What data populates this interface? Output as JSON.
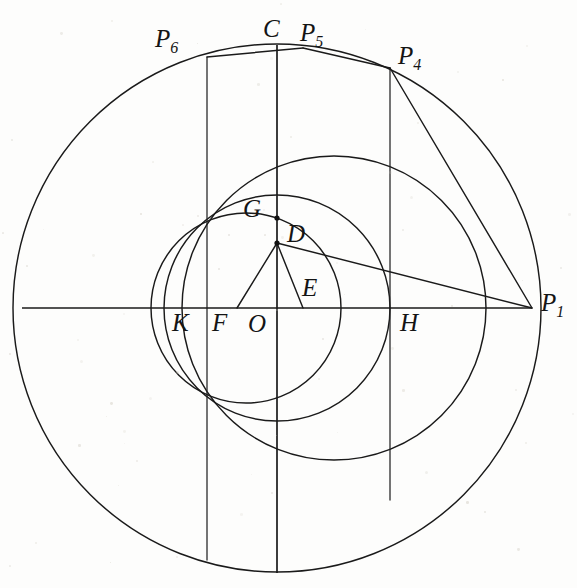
{
  "figure": {
    "background_color": "#fdfdfc",
    "ink_color": "#1a1a1a",
    "width": 577,
    "height": 588
  },
  "labels": [
    {
      "id": "P6",
      "base": "P",
      "sub": "6",
      "x": 155,
      "y": 26,
      "name": "label-p6"
    },
    {
      "id": "C",
      "base": "C",
      "sub": "",
      "x": 263,
      "y": 16,
      "name": "label-c"
    },
    {
      "id": "P5",
      "base": "P",
      "sub": "5",
      "x": 300,
      "y": 20,
      "name": "label-p5"
    },
    {
      "id": "P4",
      "base": "P",
      "sub": "4",
      "x": 398,
      "y": 43,
      "name": "label-p4"
    },
    {
      "id": "G",
      "base": "G",
      "sub": "",
      "x": 243,
      "y": 196,
      "name": "label-g"
    },
    {
      "id": "D",
      "base": "D",
      "sub": "",
      "x": 287,
      "y": 221,
      "name": "label-d"
    },
    {
      "id": "E",
      "base": "E",
      "sub": "",
      "x": 302,
      "y": 275,
      "name": "label-e"
    },
    {
      "id": "K",
      "base": "K",
      "sub": "",
      "x": 172,
      "y": 310,
      "name": "label-k"
    },
    {
      "id": "F",
      "base": "F",
      "sub": "",
      "x": 212,
      "y": 310,
      "name": "label-f"
    },
    {
      "id": "O",
      "base": "O",
      "sub": "",
      "x": 248,
      "y": 311,
      "name": "label-o"
    },
    {
      "id": "H",
      "base": "H",
      "sub": "",
      "x": 400,
      "y": 310,
      "name": "label-h"
    },
    {
      "id": "P1",
      "base": "P",
      "sub": "1",
      "x": 541,
      "y": 290,
      "name": "label-p1"
    }
  ],
  "points": {
    "O": {
      "x": 277,
      "y": 308
    },
    "C": {
      "x": 277,
      "y": 45
    },
    "P1": {
      "x": 532,
      "y": 308
    },
    "P4": {
      "x": 390,
      "y": 68
    },
    "P5": {
      "x": 303,
      "y": 48
    },
    "P6": {
      "x": 207,
      "y": 57
    },
    "D": {
      "x": 277,
      "y": 243
    },
    "G": {
      "x": 277,
      "y": 218
    },
    "E": {
      "x": 303,
      "y": 308
    },
    "F": {
      "x": 237,
      "y": 308
    },
    "K": {
      "x": 205,
      "y": 308
    },
    "H": {
      "x": 390,
      "y": 308
    }
  },
  "circles": [
    {
      "name": "outer-circle",
      "cx": 277,
      "cy": 308,
      "r": 264
    },
    {
      "name": "medium-circle",
      "cx": 334,
      "cy": 308,
      "r": 152
    },
    {
      "name": "inner-circle",
      "cx": 277,
      "cy": 308,
      "r": 113
    },
    {
      "name": "small-circle",
      "cx": 246,
      "cy": 308,
      "r": 95
    }
  ],
  "vertical_lines": [
    {
      "name": "chord-line-p6",
      "x": 207,
      "y1": 57,
      "y2": 560
    },
    {
      "name": "axis-vertical",
      "x": 277,
      "y1": 45,
      "y2": 573
    },
    {
      "name": "chord-line-p4",
      "x": 390,
      "y1": 68,
      "y2": 500
    }
  ],
  "segments": [
    {
      "name": "axis-horizontal",
      "x1": 22,
      "y1": 308,
      "x2": 532,
      "y2": 308
    },
    {
      "name": "segment-d-p1",
      "x1": 277,
      "y1": 243,
      "x2": 532,
      "y2": 308
    },
    {
      "name": "segment-d-e",
      "x1": 277,
      "y1": 243,
      "x2": 303,
      "y2": 308
    },
    {
      "name": "segment-d-f",
      "x1": 277,
      "y1": 243,
      "x2": 237,
      "y2": 308
    },
    {
      "name": "chord-p6-p5",
      "x1": 207,
      "y1": 57,
      "x2": 303,
      "y2": 48
    },
    {
      "name": "chord-p5-p4",
      "x1": 303,
      "y1": 48,
      "x2": 390,
      "y2": 68
    },
    {
      "name": "chord-p4-p1",
      "x1": 390,
      "y1": 68,
      "x2": 532,
      "y2": 308
    }
  ],
  "vertex_dots": [
    {
      "name": "dot-g",
      "cx": 277,
      "cy": 218
    },
    {
      "name": "dot-d",
      "cx": 277,
      "cy": 243
    }
  ]
}
